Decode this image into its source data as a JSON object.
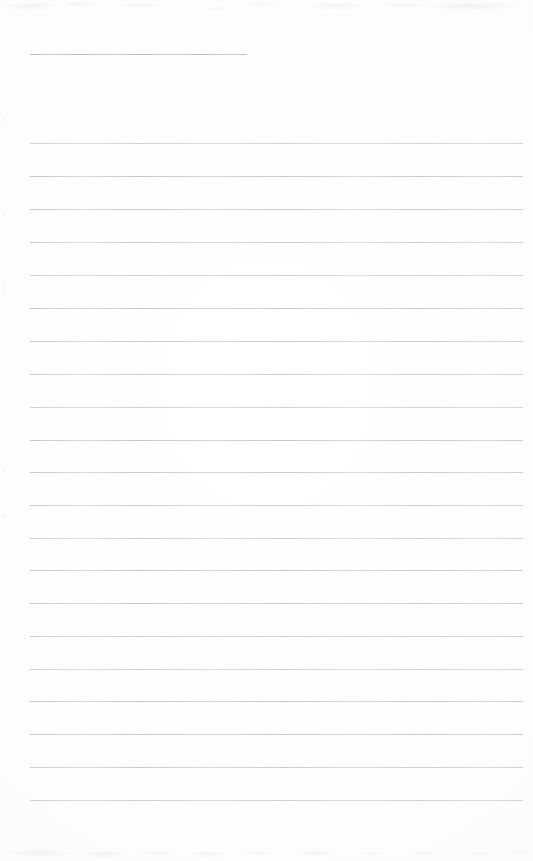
{
  "page": {
    "kind": "scanned-lined-notepaper",
    "width": 533,
    "height": 861,
    "paper_color": "#fdfdfd",
    "background_color": "#ffffff",
    "has_text_content": false,
    "note": "Blank ruled notepad sheet, no handwriting or printed text"
  },
  "rules": {
    "line_color": "#c3c7cd",
    "header_line_color": "#b8bcc2",
    "line_thickness_px": 1,
    "left_margin_px": 30,
    "right_edge_px": 523,
    "line_spacing_px": 32.85,
    "header_line": {
      "y": 54,
      "x_start": 30,
      "x_end": 247
    },
    "body_line_y_positions": [
      143,
      176,
      209,
      242,
      275,
      308,
      341,
      374,
      407,
      440,
      472,
      505,
      538,
      570,
      603,
      636,
      669,
      701,
      734,
      767,
      800
    ]
  },
  "artifacts": {
    "top_noise_band_height": 26,
    "bottom_noise_band_height": 32,
    "left_noise_band_width": 16,
    "noise_color": "#96989e"
  }
}
